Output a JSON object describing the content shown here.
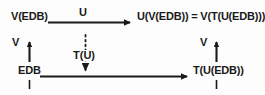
{
  "diagram": {
    "type": "commutative-square",
    "background_color": "#fdfdfd",
    "stroke_color": "#1a1a1a",
    "nodes": [
      {
        "id": "top-left",
        "label": "V(EDB)"
      },
      {
        "id": "top-right",
        "label": "U(V(EDB)) = V(T(U(EDB)))"
      },
      {
        "id": "bottom-left",
        "label": "EDB"
      },
      {
        "id": "bottom-right",
        "label": "T(U(EDB))"
      }
    ],
    "edges": [
      {
        "id": "top-edge",
        "label": "U",
        "direction": "right",
        "style": "solid",
        "from": "top-left",
        "to": "top-right"
      },
      {
        "id": "left-edge",
        "label": "V",
        "direction": "up",
        "style": "solid",
        "from": "bottom-left",
        "to": "top-left"
      },
      {
        "id": "right-edge",
        "label": "V",
        "direction": "up",
        "style": "solid",
        "from": "bottom-right",
        "to": "top-right"
      },
      {
        "id": "bottom-edge",
        "label": "",
        "direction": "right",
        "style": "solid",
        "from": "bottom-left",
        "to": "bottom-right"
      },
      {
        "id": "middle-edge",
        "label": "T(U)",
        "direction": "down",
        "style": "dotted",
        "from": "top-edge",
        "to": "bottom-edge"
      }
    ]
  }
}
